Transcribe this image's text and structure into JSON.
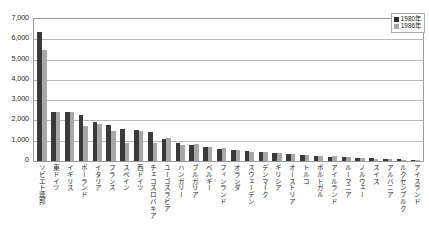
{
  "chart_data": {
    "type": "bar",
    "title": "",
    "xlabel": "",
    "ylabel": "",
    "ylim": [
      0,
      7000
    ],
    "ytick_labels": [
      "7,000",
      "6,000",
      "5,000",
      "4,000",
      "3,000",
      "2,000",
      "1,000",
      "0"
    ],
    "ytick_values": [
      7000,
      6000,
      5000,
      4000,
      3000,
      2000,
      1000,
      0
    ],
    "grid": true,
    "legend_position": "top-right",
    "categories": [
      "ソビエト連邦",
      "東ドイツ",
      "イギリス",
      "ポーランド",
      "イタリア",
      "フランス",
      "スペイン",
      "西ドイツ",
      "チェコスロバキア",
      "ユーゴスラビア",
      "ハンガリー",
      "ブルガリア",
      "ベルギー",
      "フィンランド",
      "オランダ",
      "スウェーデン",
      "デンマーク",
      "ギリシア",
      "オーストリア",
      "トルコ",
      "ポルトガル",
      "アイルランド",
      "ルーマニア",
      "ノルウェー",
      "スイス",
      "アルバニア",
      "ルクセンブルク",
      "アイスランド"
    ],
    "series": [
      {
        "name": "1980年",
        "color": "#3a3a3a",
        "values": [
          6350,
          2430,
          2400,
          2250,
          1900,
          1780,
          1600,
          1550,
          1420,
          1100,
          880,
          780,
          700,
          600,
          520,
          470,
          430,
          380,
          340,
          300,
          260,
          220,
          190,
          160,
          130,
          100,
          80,
          60
        ]
      },
      {
        "name": "1986年",
        "color": "#a8a8a8",
        "values": [
          5450,
          2430,
          2400,
          1750,
          1820,
          1500,
          900,
          1480,
          900,
          1120,
          790,
          820,
          680,
          620,
          540,
          450,
          420,
          400,
          330,
          280,
          250,
          230,
          200,
          150,
          120,
          95,
          70,
          55
        ]
      }
    ]
  },
  "legend": {
    "items": [
      {
        "label": "1980年",
        "swatch": "y1980"
      },
      {
        "label": "1986年",
        "swatch": "y1986"
      }
    ]
  }
}
